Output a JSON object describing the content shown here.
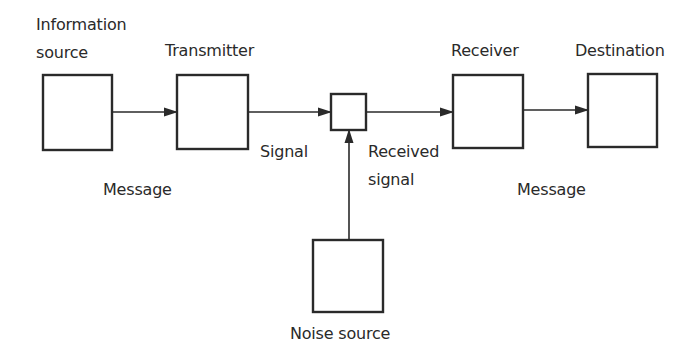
{
  "diagram": {
    "type": "communication-system-block-diagram",
    "colors": {
      "stroke": "#2a2a2a",
      "text": "#2a2a2a",
      "background": "#ffffff"
    },
    "nodes": [
      {
        "id": "information-source",
        "label_line1": "Information",
        "label_line2": "source"
      },
      {
        "id": "transmitter",
        "label": "Transmitter"
      },
      {
        "id": "channel",
        "label": ""
      },
      {
        "id": "receiver",
        "label": "Receiver"
      },
      {
        "id": "destination",
        "label": "Destination"
      },
      {
        "id": "noise-source",
        "label": "Noise source"
      }
    ],
    "edges": [
      {
        "from": "information-source",
        "to": "transmitter",
        "label": "Message"
      },
      {
        "from": "transmitter",
        "to": "channel",
        "label": "Signal"
      },
      {
        "from": "channel",
        "to": "receiver",
        "label_line1": "Received",
        "label_line2": "signal"
      },
      {
        "from": "receiver",
        "to": "destination",
        "label": "Message"
      },
      {
        "from": "noise-source",
        "to": "channel",
        "label": ""
      }
    ]
  }
}
